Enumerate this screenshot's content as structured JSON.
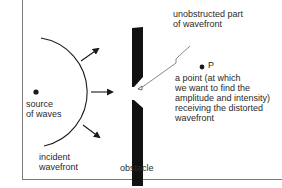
{
  "diagram": {
    "colors": {
      "ink": "#1a1a1a",
      "frame": "#7a7a7a",
      "background": "#ffffff"
    },
    "labels": {
      "unobstructed": {
        "line1": "unobstructed part",
        "line2": "of wavefront"
      },
      "point_p": "P",
      "point_desc": {
        "line1": "a point (at which",
        "line2": "we want to find the",
        "line3": "amplitude and intensity)",
        "line4": "receiving the distorted",
        "line5": "wavefront"
      },
      "source": {
        "line1": "source",
        "line2": "of waves"
      },
      "incident": {
        "line1": "incident",
        "line2": "wavefront"
      },
      "obstacle": "obstacle"
    },
    "elements": {
      "source_point": {
        "x": 36,
        "y": 92
      },
      "incident_wavefront_arc": {
        "center": [
          36,
          92
        ],
        "radius": 55
      },
      "propagation_arrows": 3,
      "obstacle_aperture": {
        "x": 138,
        "gap_top": 88,
        "gap_bottom": 99
      },
      "point_p": {
        "x": 202,
        "y": 67
      }
    }
  }
}
